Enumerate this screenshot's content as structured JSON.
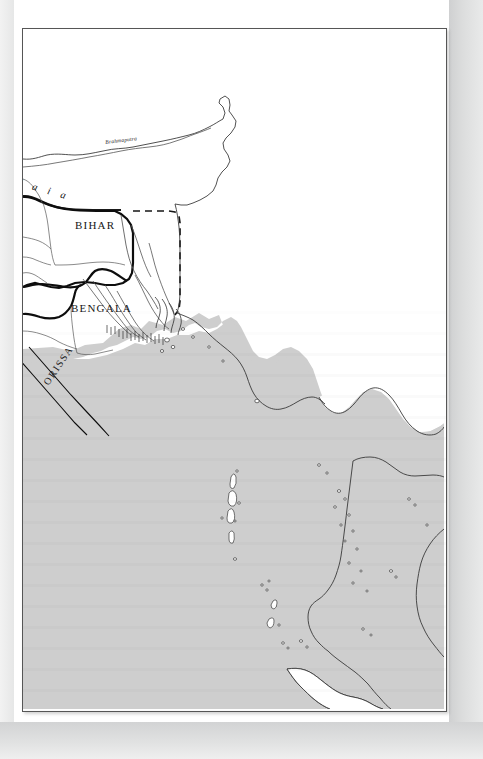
{
  "document": {
    "type": "scanned-book-page",
    "page_background": "#e4e5e5",
    "frame_background": "#ffffff",
    "frame_border_color": "#565656"
  },
  "map": {
    "title": "",
    "sea_color": "#cfcfcf",
    "land_color": "#ffffff",
    "coastline_color": "#3a3a3a",
    "province_border_color": "#0d0d0d",
    "river_color": "#555555",
    "dashed_border_color": "#1a1a1a",
    "labels": [
      {
        "id": "brahmaputra",
        "text": "Brahmaputra",
        "kind": "river-label",
        "style": "italic",
        "x": 82,
        "y": 110,
        "rotation": -7
      },
      {
        "id": "himalaia",
        "text": "l a i a",
        "kind": "range-label",
        "style": "italic",
        "x": -2,
        "y": 148,
        "rotation": 16,
        "note": "clipped by frame edge"
      },
      {
        "id": "bihar",
        "text": "BIHAR",
        "kind": "province-label",
        "x": 52,
        "y": 190,
        "rotation": 0
      },
      {
        "id": "bengala",
        "text": "BENGALA",
        "kind": "province-label",
        "x": 48,
        "y": 273,
        "rotation": 0
      },
      {
        "id": "orissa",
        "text": "ORISSA",
        "kind": "province-label",
        "x": 18,
        "y": 352,
        "rotation": -56
      }
    ],
    "features": {
      "sea_name_implied": "Bay of Bengal",
      "island_groups": 2,
      "delta": "Ganges-Brahmaputra delta",
      "peninsula": "Malay peninsula"
    }
  }
}
